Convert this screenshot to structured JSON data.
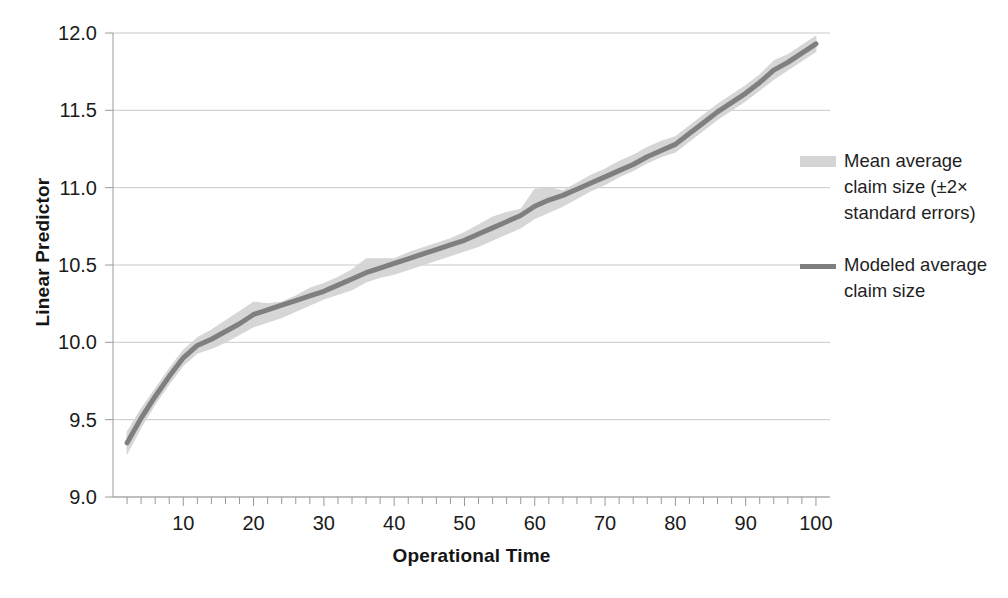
{
  "chart_data": {
    "type": "line",
    "title": "",
    "xlabel": "Operational Time",
    "ylabel": "Linear Predictor",
    "xlim": [
      0,
      102
    ],
    "ylim": [
      9.0,
      12.0
    ],
    "xticks": [
      10,
      20,
      30,
      40,
      50,
      60,
      70,
      80,
      90,
      100
    ],
    "xtick_labels": [
      "10",
      "20",
      "30",
      "40",
      "50",
      "60",
      "70",
      "80",
      "90",
      "100"
    ],
    "yticks": [
      9.0,
      9.5,
      10.0,
      10.5,
      11.0,
      11.5,
      12.0
    ],
    "ytick_labels": [
      "9.0",
      "9.5",
      "10.0",
      "10.5",
      "11.0",
      "11.5",
      "12.0"
    ],
    "minor_xtick_interval": 2,
    "grid": "horizontal",
    "legend_position": "right",
    "colors": {
      "band": "#d4d4d4",
      "line": "#7f7f7f",
      "grid": "#c9c9c9",
      "axis": "#9a9a9a",
      "text": "#1a1a1a",
      "background": "#ffffff"
    },
    "series": [
      {
        "name": "Mean average claim size (±2× standard errors)",
        "type": "band",
        "key": "band",
        "x": [
          2,
          4,
          6,
          8,
          10,
          12,
          14,
          16,
          18,
          20,
          22,
          24,
          26,
          28,
          30,
          32,
          34,
          36,
          38,
          40,
          42,
          44,
          46,
          48,
          50,
          52,
          54,
          56,
          58,
          60,
          62,
          64,
          66,
          68,
          70,
          72,
          74,
          76,
          78,
          80,
          82,
          84,
          86,
          88,
          90,
          92,
          94,
          96,
          98,
          100
        ],
        "lower": [
          9.28,
          9.45,
          9.6,
          9.73,
          9.85,
          9.93,
          9.96,
          10.0,
          10.05,
          10.1,
          10.13,
          10.16,
          10.2,
          10.24,
          10.28,
          10.31,
          10.34,
          10.39,
          10.42,
          10.44,
          10.47,
          10.5,
          10.53,
          10.56,
          10.59,
          10.62,
          10.66,
          10.7,
          10.74,
          10.8,
          10.84,
          10.88,
          10.93,
          10.98,
          11.02,
          11.07,
          11.11,
          11.16,
          11.2,
          11.23,
          11.3,
          11.37,
          11.44,
          11.5,
          11.56,
          11.63,
          11.7,
          11.76,
          11.82,
          11.88
        ],
        "upper": [
          9.42,
          9.57,
          9.7,
          9.83,
          9.95,
          10.03,
          10.08,
          10.14,
          10.2,
          10.26,
          10.25,
          10.26,
          10.3,
          10.35,
          10.38,
          10.42,
          10.47,
          10.54,
          10.54,
          10.54,
          10.58,
          10.61,
          10.64,
          10.67,
          10.71,
          10.76,
          10.81,
          10.84,
          10.86,
          10.99,
          11.0,
          10.98,
          11.03,
          11.08,
          11.12,
          11.17,
          11.21,
          11.26,
          11.3,
          11.33,
          11.4,
          11.47,
          11.54,
          11.6,
          11.66,
          11.73,
          11.82,
          11.86,
          11.92,
          11.98
        ]
      },
      {
        "name": "Modeled average claim size",
        "type": "line",
        "key": "line",
        "x": [
          2,
          4,
          6,
          8,
          10,
          12,
          14,
          16,
          18,
          20,
          22,
          24,
          26,
          28,
          30,
          32,
          34,
          36,
          38,
          40,
          42,
          44,
          46,
          48,
          50,
          52,
          54,
          56,
          58,
          60,
          62,
          64,
          66,
          68,
          70,
          72,
          74,
          76,
          78,
          80,
          82,
          84,
          86,
          88,
          90,
          92,
          94,
          96,
          98,
          100
        ],
        "y": [
          9.35,
          9.51,
          9.65,
          9.78,
          9.9,
          9.98,
          10.02,
          10.07,
          10.12,
          10.18,
          10.21,
          10.24,
          10.27,
          10.3,
          10.33,
          10.37,
          10.41,
          10.45,
          10.48,
          10.51,
          10.54,
          10.57,
          10.6,
          10.63,
          10.66,
          10.7,
          10.74,
          10.78,
          10.82,
          10.88,
          10.92,
          10.95,
          10.99,
          11.03,
          11.07,
          11.11,
          11.15,
          11.2,
          11.24,
          11.28,
          11.35,
          11.42,
          11.49,
          11.55,
          11.61,
          11.68,
          11.76,
          11.81,
          11.87,
          11.93
        ]
      }
    ]
  },
  "legend": {
    "entries": [
      {
        "label": "Mean average claim size (±2× standard errors)",
        "key": "band"
      },
      {
        "label": "Modeled average claim size",
        "key": "line"
      }
    ]
  },
  "axes": {
    "x_title": "Operational Time",
    "y_title": "Linear Predictor"
  }
}
